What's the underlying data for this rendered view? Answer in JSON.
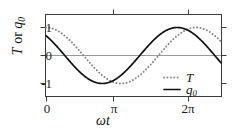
{
  "chart_data": {
    "type": "line",
    "title": "",
    "xlabel": "ωt",
    "ylabel": "T or q₀",
    "ylabel_parts": {
      "first": "T",
      "conj": " or ",
      "second": "q",
      "second_sub": "0"
    },
    "xlim": [
      0,
      7.3304
    ],
    "ylim": [
      -1.45,
      1.45
    ],
    "grid": false,
    "zero_line": true,
    "xticks": [
      0,
      3.1416,
      6.2832
    ],
    "xticklabels": [
      "0",
      "π",
      "2π"
    ],
    "yticks": [
      1,
      0,
      -1
    ],
    "yticklabels": [
      "1",
      "0",
      "-1"
    ],
    "legend_position": "lower right",
    "series": [
      {
        "name": "T",
        "style": "dotted",
        "color": "#808080",
        "amplitude": 1.0,
        "phase_deg": 0,
        "formula": "cos(wt)",
        "x": [
          0,
          0.3927,
          0.7854,
          1.1781,
          1.5708,
          1.9635,
          2.3562,
          2.7489,
          3.1416,
          3.5343,
          3.927,
          4.3197,
          4.7124,
          5.1051,
          5.4978,
          5.8905,
          6.2832,
          6.6759,
          7.0686,
          7.3304
        ],
        "values": [
          1.0,
          0.924,
          0.707,
          0.383,
          0.0,
          -0.383,
          -0.707,
          -0.924,
          -1.0,
          -0.924,
          -0.707,
          -0.383,
          0.0,
          0.383,
          0.707,
          0.924,
          1.0,
          0.924,
          0.707,
          0.54
        ]
      },
      {
        "name": "q₀",
        "name_base": "q",
        "name_sub": "0",
        "style": "solid",
        "color": "#111111",
        "amplitude": 1.0,
        "phase_deg": 45,
        "formula": "cos(wt + pi/4)",
        "x": [
          0,
          0.3927,
          0.7854,
          1.1781,
          1.5708,
          1.9635,
          2.3562,
          2.7489,
          3.1416,
          3.5343,
          3.927,
          4.3197,
          4.7124,
          5.1051,
          5.4978,
          5.8905,
          6.2832,
          6.6759,
          7.0686,
          7.3304
        ],
        "values": [
          0.707,
          0.383,
          0.0,
          -0.383,
          -0.707,
          -0.924,
          -1.0,
          -0.924,
          -0.707,
          -0.383,
          0.0,
          0.383,
          0.707,
          0.924,
          1.0,
          0.924,
          0.707,
          0.383,
          0.0,
          -0.26
        ]
      }
    ]
  },
  "legend": {
    "entries": [
      {
        "label": "T",
        "style": "dotted"
      },
      {
        "label": "q",
        "sub": "0",
        "style": "solid"
      }
    ]
  },
  "axes": {
    "x_tick_0": "0",
    "x_tick_pi": "π",
    "x_tick_2pi": "2π",
    "y_tick_pos1": "1",
    "y_tick_zero": "0",
    "y_tick_neg1": "-1"
  },
  "colors": {
    "frame": "#3c3c3c",
    "zero_line": "#9a9a9a",
    "solid_curve": "#111111",
    "dotted_curve": "#8a8a8a",
    "background": "#ffffff"
  }
}
